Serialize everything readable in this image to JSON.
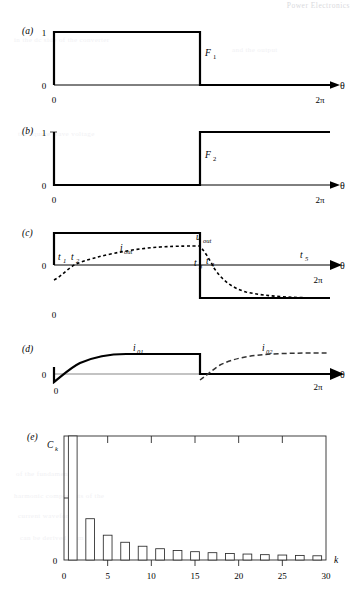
{
  "page": {
    "ghost_header": "Power Electronics",
    "ghost_lines": [
      "in the dc side of the converter",
      "and the output",
      "the square wave voltage",
      "of the fundamental",
      "harmonic components of the",
      "current waveform",
      "can be derived from the"
    ]
  },
  "panels": {
    "a": {
      "label": "(a)",
      "y_high": "1",
      "y_zero": "0",
      "x_zero": "0",
      "x_end": "2π",
      "axis_label": "θ",
      "curve_label": "F",
      "curve_sub": "1"
    },
    "b": {
      "label": "(b)",
      "y_high": "1",
      "y_zero": "0",
      "x_zero": "0",
      "x_end": "2π",
      "axis_label": "θ",
      "curve_label": "F",
      "curve_sub": "2"
    },
    "c": {
      "label": "(c)",
      "y_zero": "0",
      "x_zero": "0",
      "x_end": "2π",
      "axis_label": "θ",
      "voltage_label": "u",
      "voltage_sub": "out",
      "current_label": "i",
      "current_sub": "out",
      "markers": [
        {
          "name": "t",
          "sub": "1"
        },
        {
          "name": "t",
          "sub": "2"
        },
        {
          "name": "t",
          "sub": "3"
        },
        {
          "name": "t",
          "sub": "4"
        },
        {
          "name": "t",
          "sub": "5"
        }
      ]
    },
    "d": {
      "label": "(d)",
      "y_zero": "0",
      "x_zero": "0",
      "x_end": "2π",
      "axis_label": "θ",
      "current1_label": "i",
      "current1_sub": "01",
      "current2_label": "i",
      "current2_sub": "02"
    },
    "e": {
      "label": "(e)",
      "y_axis_label": "C",
      "y_axis_sub": "k",
      "y_zero": "0",
      "x_axis_label": "k"
    }
  },
  "chart_data": {
    "type": "bar",
    "title": "",
    "xlabel": "k",
    "ylabel": "C_k",
    "xlim": [
      0,
      30
    ],
    "ylim": [
      0,
      1
    ],
    "xticks": [
      0,
      5,
      10,
      15,
      20,
      25,
      30
    ],
    "yticks": [
      0,
      0.5
    ],
    "ytick_labels": [
      "0",
      ""
    ],
    "grid": false,
    "legend": null,
    "categories": [
      1,
      3,
      5,
      7,
      9,
      11,
      13,
      15,
      17,
      19,
      21,
      23,
      25,
      27,
      29
    ],
    "values": [
      1.0,
      0.333,
      0.2,
      0.143,
      0.111,
      0.091,
      0.077,
      0.067,
      0.059,
      0.053,
      0.048,
      0.043,
      0.04,
      0.037,
      0.034
    ],
    "bar_width": 1,
    "note": "odd-harmonic amplitude spectrum, 1/k envelope"
  }
}
